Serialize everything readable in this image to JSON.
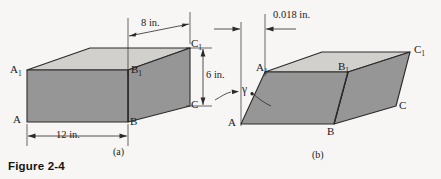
{
  "figure": {
    "caption": "Figure 2-4",
    "background_color": "#f7f6f4",
    "line_color": "#2a2a2a",
    "top_face_color": "#d2d0cd",
    "side_face_color": "#969696",
    "panels": [
      {
        "id": "a",
        "sublabel": "(a)",
        "description": "undeformed rectangular block",
        "vertex_labels": [
          {
            "name": "A1",
            "base": "A",
            "sub": "1"
          },
          {
            "name": "B1",
            "base": "B",
            "sub": "1"
          },
          {
            "name": "C1",
            "base": "C",
            "sub": "1"
          },
          {
            "name": "A",
            "base": "A",
            "sub": ""
          },
          {
            "name": "B",
            "base": "B",
            "sub": ""
          },
          {
            "name": "C",
            "base": "C",
            "sub": ""
          }
        ],
        "dimensions": [
          {
            "name": "depth",
            "label": "8 in.",
            "value": 8,
            "unit": "in.",
            "orientation": "horizontal"
          },
          {
            "name": "height",
            "label": "6 in.",
            "value": 6,
            "unit": "in.",
            "orientation": "vertical"
          },
          {
            "name": "width",
            "label": "12 in.",
            "value": 12,
            "unit": "in.",
            "orientation": "horizontal"
          }
        ]
      },
      {
        "id": "b",
        "sublabel": "(b)",
        "description": "sheared block showing deformation",
        "vertex_labels": [
          {
            "name": "A1",
            "base": "A",
            "sub": "1"
          },
          {
            "name": "B1",
            "base": "B",
            "sub": "1"
          },
          {
            "name": "C1",
            "base": "C",
            "sub": "1"
          },
          {
            "name": "A",
            "base": "A",
            "sub": ""
          },
          {
            "name": "B",
            "base": "B",
            "sub": ""
          },
          {
            "name": "C",
            "base": "C",
            "sub": ""
          }
        ],
        "dimensions": [
          {
            "name": "shear-displacement",
            "label": "0.018 in.",
            "value": 0.018,
            "unit": "in.",
            "orientation": "horizontal"
          }
        ],
        "angles": [
          {
            "name": "shear-strain-angle",
            "symbol": "γ"
          }
        ]
      }
    ]
  }
}
